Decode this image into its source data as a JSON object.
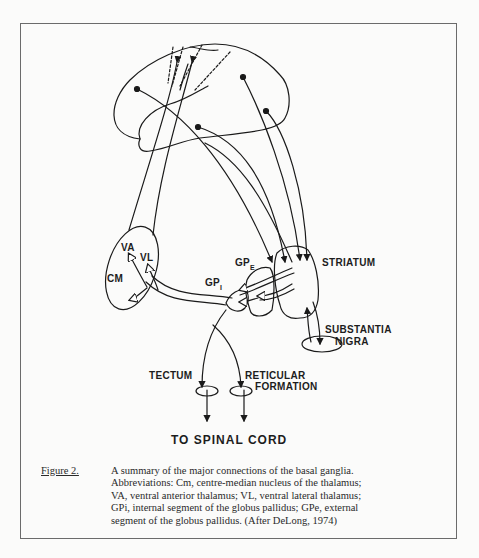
{
  "figure": {
    "labels": {
      "va": "VA",
      "vl": "VL",
      "cm": "CM",
      "gpe_main": "GP",
      "gpe_sub": "E",
      "gpi_main": "GP",
      "gpi_sub": "I",
      "striatum": "STRIATUM",
      "substantia_1": "SUBSTANTIA",
      "substantia_2": "NIGRA",
      "tectum": "TECTUM",
      "reticular_1": "RETICULAR",
      "reticular_2": "FORMATION",
      "spinal": "TO SPINAL CORD"
    },
    "caption": {
      "label": "Figure 2.",
      "lines": [
        "A summary of the major connections of the basal ganglia.",
        "Abbreviations: Cm, centre-median nucleus of the thalamus;",
        "VA, ventral anterior thalamus; VL, ventral lateral thalamus;",
        "GPi, internal segment of the globus pallidus; GPe, external",
        "segment of the globus pallidus. (After DeLong, 1974)"
      ]
    }
  }
}
